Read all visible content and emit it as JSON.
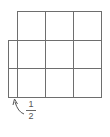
{
  "diagram": {
    "grid": {
      "rows": 3,
      "cols": 3,
      "line_color": "#6e6e6e"
    },
    "extra_strip": {
      "width_fraction": "1/2",
      "rows_covered": 2
    },
    "label": {
      "numerator": "1",
      "denominator": "2"
    }
  }
}
